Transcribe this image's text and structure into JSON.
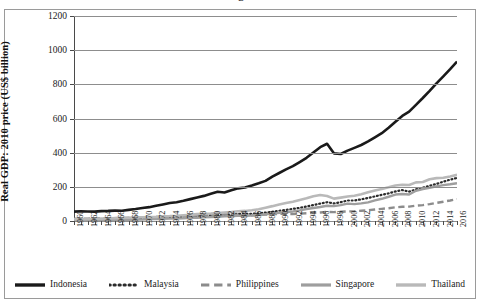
{
  "figure": {
    "cropped_title_fragment": "g"
  },
  "chart_data": {
    "type": "line",
    "title": "",
    "xlabel": "",
    "ylabel": "Real GDP: 2010 price (US$ billion)",
    "ylim": [
      0,
      1200
    ],
    "ytick_values": [
      0,
      200,
      400,
      600,
      800,
      1000,
      1200
    ],
    "ytick_labels": [
      "0",
      "200",
      "400",
      "600",
      "800",
      "1000",
      "1200"
    ],
    "grid": "horizontal",
    "legend_position": "bottom",
    "xlim": [
      1960,
      2016
    ],
    "x": [
      1960,
      1961,
      1962,
      1963,
      1964,
      1965,
      1966,
      1967,
      1968,
      1969,
      1970,
      1971,
      1972,
      1973,
      1974,
      1975,
      1976,
      1977,
      1978,
      1979,
      1980,
      1981,
      1982,
      1983,
      1984,
      1985,
      1986,
      1987,
      1988,
      1989,
      1990,
      1991,
      1992,
      1993,
      1994,
      1995,
      1996,
      1997,
      1998,
      1999,
      2000,
      2001,
      2002,
      2003,
      2004,
      2005,
      2006,
      2007,
      2008,
      2009,
      2010,
      2011,
      2012,
      2013,
      2014,
      2015,
      2016
    ],
    "xtick_labels": [
      "1960",
      "1962",
      "1964",
      "1966",
      "1968",
      "1970",
      "1972",
      "1974",
      "1976",
      "1978",
      "1980",
      "1982",
      "1984",
      "1986",
      "1988",
      "1990",
      "1992",
      "1994",
      "1996",
      "1998",
      "2000",
      "2002",
      "2004",
      "2006",
      "2008",
      "2010",
      "2012",
      "2014",
      "2016"
    ],
    "series": [
      {
        "name": "Indonesia",
        "color": "#1a1a1a",
        "style": "solid",
        "width": 2.6,
        "values": [
          55,
          57,
          56,
          55,
          58,
          59,
          61,
          60,
          65,
          70,
          76,
          81,
          89,
          97,
          105,
          110,
          118,
          128,
          138,
          147,
          159,
          171,
          167,
          180,
          191,
          196,
          208,
          221,
          235,
          260,
          281,
          302,
          321,
          345,
          370,
          401,
          432,
          452,
          396,
          392,
          412,
          428,
          445,
          466,
          490,
          514,
          546,
          581,
          615,
          640,
          680,
          720,
          762,
          806,
          847,
          889,
          933
        ]
      },
      {
        "name": "Malaysia",
        "color": "#2b2b2b",
        "style": "dotted",
        "width": 2.2,
        "values": [
          8,
          8,
          9,
          10,
          10,
          11,
          12,
          13,
          13,
          14,
          16,
          17,
          18,
          20,
          21,
          22,
          24,
          26,
          28,
          30,
          33,
          34,
          36,
          39,
          42,
          41,
          42,
          45,
          49,
          54,
          60,
          65,
          71,
          77,
          85,
          93,
          102,
          110,
          103,
          110,
          120,
          120,
          127,
          135,
          144,
          153,
          162,
          173,
          181,
          172,
          185,
          195,
          206,
          217,
          230,
          242,
          252
        ]
      },
      {
        "name": "Philippines",
        "color": "#8c8c8c",
        "style": "dashed",
        "width": 2.4,
        "values": [
          13,
          14,
          14,
          15,
          16,
          17,
          17,
          18,
          19,
          20,
          21,
          22,
          23,
          25,
          26,
          27,
          29,
          30,
          32,
          34,
          36,
          37,
          38,
          38,
          35,
          33,
          34,
          35,
          38,
          40,
          42,
          41,
          41,
          43,
          45,
          47,
          50,
          53,
          52,
          54,
          56,
          57,
          60,
          63,
          67,
          71,
          75,
          80,
          83,
          84,
          90,
          93,
          99,
          106,
          113,
          120,
          128
        ]
      },
      {
        "name": "Singapore",
        "color": "#9e9e9e",
        "style": "solid-gray",
        "width": 2.4,
        "values": [
          4,
          4,
          4,
          5,
          5,
          5,
          6,
          7,
          7,
          8,
          9,
          11,
          12,
          13,
          14,
          15,
          16,
          18,
          19,
          21,
          23,
          25,
          27,
          29,
          31,
          31,
          32,
          35,
          39,
          43,
          48,
          52,
          56,
          62,
          70,
          76,
          82,
          89,
          87,
          93,
          102,
          99,
          103,
          109,
          121,
          130,
          142,
          155,
          158,
          155,
          177,
          187,
          194,
          203,
          210,
          215,
          221
        ]
      },
      {
        "name": "Thailand",
        "color": "#b9b9b9",
        "style": "solid-light",
        "width": 2.6,
        "values": [
          10,
          11,
          12,
          13,
          14,
          15,
          17,
          18,
          19,
          21,
          22,
          23,
          24,
          28,
          29,
          31,
          34,
          36,
          40,
          42,
          44,
          47,
          50,
          53,
          57,
          59,
          63,
          69,
          78,
          87,
          97,
          105,
          113,
          123,
          133,
          145,
          152,
          146,
          131,
          137,
          143,
          148,
          157,
          168,
          179,
          187,
          197,
          208,
          212,
          211,
          226,
          228,
          244,
          251,
          253,
          261,
          270
        ]
      }
    ],
    "annotations": [
      {
        "label": "Asian Financial Crisis contraction",
        "year": 1998
      }
    ]
  },
  "legend": {
    "items": [
      {
        "label": "Indonesia"
      },
      {
        "label": "Malaysia"
      },
      {
        "label": "Philippines"
      },
      {
        "label": "Singapore"
      },
      {
        "label": "Thailand"
      }
    ]
  }
}
